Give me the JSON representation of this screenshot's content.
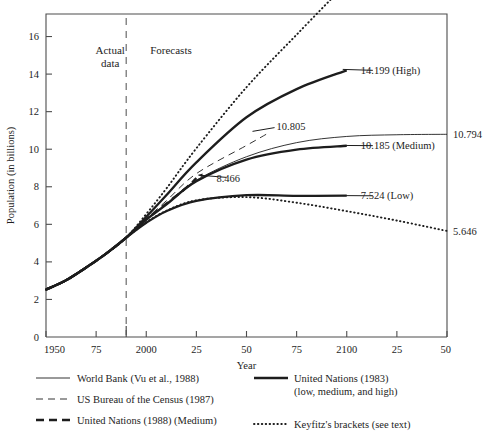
{
  "chart_data": {
    "type": "line",
    "title": "",
    "xlabel": "Year",
    "ylabel": "Population (in billions)",
    "xlim": [
      1950,
      2150
    ],
    "ylim": [
      0,
      17.2
    ],
    "grid": false,
    "legend_position": "below-axis",
    "x_ticks": [
      {
        "value": 1950,
        "label": "1950"
      },
      {
        "value": 1975,
        "label": "75"
      },
      {
        "value": 2000,
        "label": "2000"
      },
      {
        "value": 2025,
        "label": "25"
      },
      {
        "value": 2050,
        "label": "50"
      },
      {
        "value": 2075,
        "label": "75"
      },
      {
        "value": 2100,
        "label": "2100"
      },
      {
        "value": 2125,
        "label": "25"
      },
      {
        "value": 2150,
        "label": "50"
      }
    ],
    "y_ticks": [
      {
        "value": 0,
        "label": "0"
      },
      {
        "value": 2,
        "label": "2"
      },
      {
        "value": 4,
        "label": "4"
      },
      {
        "value": 6,
        "label": "6"
      },
      {
        "value": 8,
        "label": "8"
      },
      {
        "value": 10,
        "label": "10"
      },
      {
        "value": 12,
        "label": "12"
      },
      {
        "value": 14,
        "label": "14"
      },
      {
        "value": 16,
        "label": "16"
      }
    ],
    "divider": {
      "value": 1990,
      "style": "dashed",
      "label_left": "Actual\ndata",
      "label_right": "Forecasts"
    },
    "series": [
      {
        "name": "World Bank (Vu et al., 1988)",
        "style": "thin-solid",
        "end_label": "10.794",
        "points": [
          [
            1950,
            2.52
          ],
          [
            1960,
            3.02
          ],
          [
            1970,
            3.7
          ],
          [
            1980,
            4.44
          ],
          [
            1990,
            5.29
          ],
          [
            2000,
            6.25
          ],
          [
            2010,
            7.1
          ],
          [
            2025,
            8.35
          ],
          [
            2050,
            9.6
          ],
          [
            2075,
            10.35
          ],
          [
            2100,
            10.68
          ],
          [
            2125,
            10.77
          ],
          [
            2150,
            10.794
          ]
        ]
      },
      {
        "name": "US Bureau of the Census (1987)",
        "style": "thin-dashed",
        "end_label": "10.805",
        "points": [
          [
            1950,
            2.52
          ],
          [
            1960,
            3.02
          ],
          [
            1970,
            3.7
          ],
          [
            1980,
            4.44
          ],
          [
            1990,
            5.29
          ],
          [
            2000,
            6.3
          ],
          [
            2010,
            7.25
          ],
          [
            2025,
            8.7
          ],
          [
            2050,
            10.2
          ],
          [
            2060,
            10.805
          ]
        ]
      },
      {
        "name": "United Nations (1988) (Medium)",
        "style": "thick-dashed",
        "end_label": "8.466",
        "points": [
          [
            1950,
            2.52
          ],
          [
            1960,
            3.02
          ],
          [
            1970,
            3.7
          ],
          [
            1980,
            4.44
          ],
          [
            1990,
            5.29
          ],
          [
            2000,
            6.26
          ],
          [
            2010,
            7.1
          ],
          [
            2020,
            7.95
          ],
          [
            2025,
            8.466
          ]
        ]
      },
      {
        "name": "United Nations (1983) high",
        "style": "thick-solid",
        "end_label": "14.199 (High)",
        "points": [
          [
            1950,
            2.52
          ],
          [
            1960,
            3.02
          ],
          [
            1970,
            3.7
          ],
          [
            1980,
            4.44
          ],
          [
            1990,
            5.29
          ],
          [
            2000,
            6.4
          ],
          [
            2010,
            7.55
          ],
          [
            2025,
            9.3
          ],
          [
            2050,
            11.7
          ],
          [
            2075,
            13.2
          ],
          [
            2100,
            14.199
          ]
        ]
      },
      {
        "name": "United Nations (1983) medium",
        "style": "thick-solid",
        "end_label": "10.185 (Medium)",
        "points": [
          [
            1950,
            2.52
          ],
          [
            1960,
            3.02
          ],
          [
            1970,
            3.7
          ],
          [
            1980,
            4.44
          ],
          [
            1990,
            5.29
          ],
          [
            2000,
            6.25
          ],
          [
            2010,
            7.05
          ],
          [
            2025,
            8.3
          ],
          [
            2050,
            9.45
          ],
          [
            2075,
            9.98
          ],
          [
            2100,
            10.185
          ]
        ]
      },
      {
        "name": "United Nations (1983) low",
        "style": "thick-solid",
        "end_label": "7.524 (Low)",
        "points": [
          [
            1950,
            2.52
          ],
          [
            1960,
            3.02
          ],
          [
            1970,
            3.7
          ],
          [
            1980,
            4.44
          ],
          [
            1990,
            5.29
          ],
          [
            2000,
            6.08
          ],
          [
            2010,
            6.7
          ],
          [
            2025,
            7.25
          ],
          [
            2050,
            7.55
          ],
          [
            2075,
            7.52
          ],
          [
            2100,
            7.524
          ]
        ]
      },
      {
        "name": "Keyfitz's brackets upper",
        "style": "dotted",
        "end_label": "20.635",
        "points": [
          [
            1950,
            2.52
          ],
          [
            1960,
            3.02
          ],
          [
            1970,
            3.7
          ],
          [
            1980,
            4.44
          ],
          [
            1990,
            5.29
          ],
          [
            2000,
            6.55
          ],
          [
            2010,
            7.9
          ],
          [
            2025,
            10.05
          ],
          [
            2050,
            13.3
          ],
          [
            2075,
            16.1
          ],
          [
            2100,
            18.85
          ]
        ]
      },
      {
        "name": "Keyfitz's brackets lower",
        "style": "dotted",
        "end_label": "5.646",
        "points": [
          [
            1950,
            2.52
          ],
          [
            1960,
            3.02
          ],
          [
            1970,
            3.7
          ],
          [
            1980,
            4.44
          ],
          [
            1990,
            5.29
          ],
          [
            2000,
            6.1
          ],
          [
            2010,
            6.72
          ],
          [
            2025,
            7.28
          ],
          [
            2050,
            7.45
          ],
          [
            2075,
            7.15
          ],
          [
            2100,
            6.7
          ],
          [
            2125,
            6.2
          ],
          [
            2150,
            5.646
          ]
        ]
      }
    ],
    "annotations": [
      {
        "text": "20.635",
        "x": 2105,
        "y": 19.6
      },
      {
        "text": "14.199 (High)",
        "x": 2105,
        "y": 14.2
      },
      {
        "text": "10.805",
        "x": 2063,
        "y": 11.2
      },
      {
        "text": "10.185 (Medium)",
        "x": 2105,
        "y": 10.185
      },
      {
        "text": "8.466",
        "x": 2033,
        "y": 8.47
      },
      {
        "text": "7.524 (Low)",
        "x": 2105,
        "y": 7.524
      },
      {
        "text": "10.794",
        "x": 2156,
        "y": 10.794
      },
      {
        "text": "5.646",
        "x": 2156,
        "y": 5.646
      }
    ]
  },
  "region_labels": {
    "actual_line1": "Actual",
    "actual_line2": "data",
    "forecasts": "Forecasts"
  },
  "axis": {
    "ylabel": "Population (in billions)",
    "xlabel": "Year"
  },
  "legend": {
    "left_column": [
      {
        "label": "World Bank (Vu et al., 1988)",
        "style": "thin-solid"
      },
      {
        "label": "US Bureau of the Census (1987)",
        "style": "thin-dashed"
      },
      {
        "label": "United Nations (1988) (Medium)",
        "style": "thick-dashed"
      }
    ],
    "right_column": [
      {
        "label_line1": "United Nations (1983)",
        "label_line2": "(low, medium, and high)",
        "style": "thick-solid"
      },
      {
        "label_line1": "Keyfitz's brackets (see text)",
        "label_line2": "",
        "style": "dotted"
      }
    ]
  },
  "colors": {
    "ink": "#1d1d1d",
    "axis": "#4d4d4d",
    "background": "#ffffff"
  }
}
